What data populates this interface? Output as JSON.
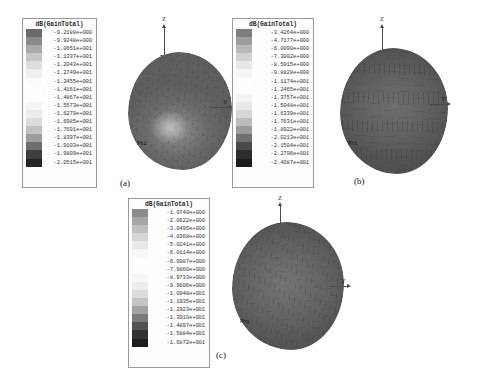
{
  "figure": {
    "background": "#ffffff",
    "legend_title": "dB(GainTotal)",
    "axis_labels": {
      "z": "Z",
      "y": "Y"
    },
    "annotations": {
      "theta": "Theta",
      "phi": "Phi"
    }
  },
  "panels": [
    {
      "id": "a",
      "caption": "(a)",
      "legend_title": "dB(GainTotal)",
      "axis_z": "Z",
      "axis_y": "Y",
      "ann_theta": "Theta",
      "ann_phi": "Phi",
      "scale_values": [
        "-9.2188e+000",
        "-9.9248e+000",
        "-1.0651e+001",
        "-1.1337e+001",
        "-1.2043e+001",
        "-1.2749e+001",
        "-1.3455e+001",
        "-1.4161e+001",
        "-1.4867e+001",
        "-1.5573e+001",
        "-1.6279e+001",
        "-1.6985e+001",
        "-1.7691e+001",
        "-1.8397e+001",
        "-1.9103e+001",
        "-1.9809e+001",
        "-2.0515e+001"
      ]
    },
    {
      "id": "b",
      "caption": "(b)",
      "legend_title": "dB(GainTotal)",
      "axis_z": "Z",
      "axis_y": "Y",
      "ann_theta": "Theta",
      "ann_phi": "Phi",
      "scale_values": [
        "-3.4264e+000",
        "-4.7177e+000",
        "-6.0090e+000",
        "-7.3002e+000",
        "-8.5915e+000",
        "-9.8828e+000",
        "-1.1174e+001",
        "-1.2465e+001",
        "-1.3757e+001",
        "-1.5048e+001",
        "-1.6339e+001",
        "-1.7631e+001",
        "-1.8922e+001",
        "-2.0213e+001",
        "-2.1504e+001",
        "-2.2796e+001",
        "-2.4087e+001"
      ]
    },
    {
      "id": "c",
      "caption": "(c)",
      "legend_title": "dB(GainTotal)",
      "axis_z": "Z",
      "axis_y": "Y",
      "ann_theta": "Theta",
      "ann_phi": "Phi",
      "scale_values": [
        "-1.0740e+000",
        "-2.0622e+000",
        "-3.0495e+000",
        "-4.0368e+000",
        "-5.0241e+000",
        "-6.0114e+000",
        "-6.9987e+000",
        "-7.9860e+000",
        "-8.9733e+000",
        "-9.9606e+000",
        "-1.0948e+001",
        "-1.1935e+001",
        "-1.2923e+001",
        "-1.3910e+001",
        "-1.4897e+001",
        "-1.5884e+001",
        "-1.6872e+001"
      ]
    }
  ],
  "chart_data": {
    "type": "heatmap",
    "xlabel": "Y",
    "ylabel": "Z",
    "grid": false,
    "legend_position": "left-of-plot",
    "series": [
      {
        "name": "(a) dB(GainTotal)",
        "unit": "dB",
        "values": [
          -9.2188,
          -9.9248,
          -10.651,
          -11.337,
          -12.043,
          -12.749,
          -13.455,
          -14.161,
          -14.867,
          -15.573,
          -16.279,
          -16.985,
          -17.691,
          -18.397,
          -19.103,
          -19.809,
          -20.515
        ],
        "range": [
          -20.515,
          -9.2188
        ]
      },
      {
        "name": "(b) dB(GainTotal)",
        "unit": "dB",
        "values": [
          -3.4264,
          -4.7177,
          -6.009,
          -7.3002,
          -8.5915,
          -9.8828,
          -11.174,
          -12.465,
          -13.757,
          -15.048,
          -16.339,
          -17.631,
          -18.922,
          -20.213,
          -21.504,
          -22.796,
          -24.087
        ],
        "range": [
          -24.087,
          -3.4264
        ]
      },
      {
        "name": "(c) dB(GainTotal)",
        "unit": "dB",
        "values": [
          -1.074,
          -2.0622,
          -3.0495,
          -4.0368,
          -5.0241,
          -6.0114,
          -6.9987,
          -7.986,
          -8.9733,
          -9.9606,
          -10.948,
          -11.935,
          -12.923,
          -13.91,
          -14.897,
          -15.884,
          -16.872
        ],
        "range": [
          -16.872,
          -1.074
        ]
      }
    ]
  }
}
